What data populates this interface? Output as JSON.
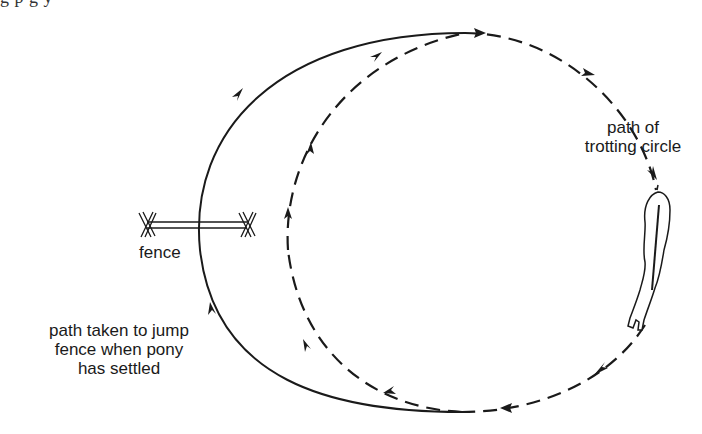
{
  "diagram": {
    "type": "riding-exercise-plan",
    "top_text_fragment": "g p g y",
    "labels": {
      "trotting_circle": [
        "path of",
        "trotting circle"
      ],
      "fence": "fence",
      "jump_path": [
        "path taken to jump",
        "fence when pony",
        "has settled"
      ]
    },
    "elements": {
      "trotting_circle": {
        "style": "dashed",
        "direction": "clockwise",
        "arrow_count": 8
      },
      "jump_path": {
        "style": "solid",
        "direction": "clockwise",
        "arrow_count": 2
      },
      "fence": {
        "style": "double-rail with X-shaped stands"
      },
      "pony": {
        "style": "top-down line drawing",
        "position": "right side of circle"
      }
    },
    "colors": {
      "ink": "#1a1a1a",
      "background": "#ffffff"
    }
  }
}
